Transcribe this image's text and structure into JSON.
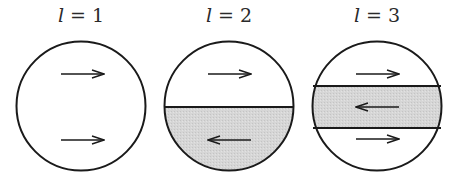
{
  "diagram": {
    "colors": {
      "stroke": "#1a1a1a",
      "shade": "#d4d4d4",
      "background": "#ffffff"
    },
    "panels": [
      {
        "label_var": "l",
        "label_eq": " = ",
        "label_val": "1",
        "center": [
          81,
          106
        ],
        "radius": 65,
        "regions": [
          {
            "shaded": false,
            "arrow": "right",
            "y": 74
          },
          {
            "shaded": false,
            "arrow": "right",
            "y": 140
          }
        ]
      },
      {
        "label_var": "l",
        "label_eq": " = ",
        "label_val": "2",
        "center": [
          229,
          106
        ],
        "radius": 65,
        "dividers": [
          107
        ],
        "regions": [
          {
            "shaded": false,
            "arrow": "right",
            "y": 74
          },
          {
            "shaded": true,
            "arrow": "left",
            "y": 140
          }
        ]
      },
      {
        "label_var": "l",
        "label_eq": " = ",
        "label_val": "3",
        "center": [
          377,
          106
        ],
        "radius": 65,
        "dividers": [
          86,
          128
        ],
        "regions": [
          {
            "shaded": false,
            "arrow": "right",
            "y": 74
          },
          {
            "shaded": true,
            "arrow": "left",
            "y": 107
          },
          {
            "shaded": false,
            "arrow": "right",
            "y": 139
          }
        ]
      }
    ]
  }
}
